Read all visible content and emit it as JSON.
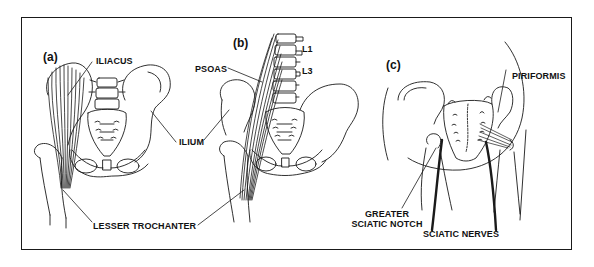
{
  "figure": {
    "panels": [
      {
        "id": "a",
        "label": "(a)",
        "annotations": [
          "ILIACUS",
          "ILIUM"
        ]
      },
      {
        "id": "b",
        "label": "(b)",
        "annotations": [
          "PSOAS",
          "L1",
          "L3"
        ]
      },
      {
        "id": "c",
        "label": "(c)",
        "annotations": [
          "PIRIFORMIS",
          "GREATER SCIATIC NOTCH",
          "SCIATIC NERVES"
        ]
      }
    ],
    "shared_annotations": [
      "LESSER TROCHANTER"
    ],
    "labels": {
      "panel_a": "(a)",
      "panel_b": "(b)",
      "panel_c": "(c)",
      "iliacus": "ILIACUS",
      "ilium": "ILIUM",
      "psoas": "PSOAS",
      "l1": "L1",
      "l3": "L3",
      "lesser_trochanter": "LESSER TROCHANTER",
      "piriformis": "PIRIFORMIS",
      "greater_sciatic_notch_line1": "GREATER",
      "greater_sciatic_notch_line2": "SCIATIC NOTCH",
      "sciatic_nerves": "SCIATIC NERVES"
    },
    "colors": {
      "line": "#1a1a1a",
      "background": "#ffffff"
    }
  }
}
